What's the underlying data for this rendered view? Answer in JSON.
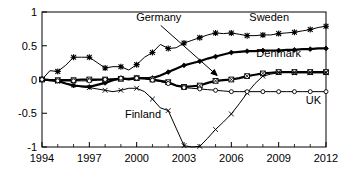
{
  "chart_data": {
    "type": "line",
    "title": "",
    "xlabel": "",
    "ylabel": "",
    "xlim": [
      1994,
      2012
    ],
    "ylim": [
      -1,
      1
    ],
    "grid": false,
    "legend_position": "inline-annotations",
    "xticks": [
      1994,
      1997,
      2000,
      2003,
      2006,
      2009,
      2012
    ],
    "xtick_labels": [
      "1994",
      "1997",
      "2000",
      "2003",
      "2006",
      "2009",
      "2012"
    ],
    "xminor_ticks": [
      1995,
      1996,
      1998,
      1999,
      2001,
      2002,
      2004,
      2005,
      2007,
      2008,
      2010,
      2011
    ],
    "yticks": [
      -1,
      -0.5,
      0,
      0.5,
      1
    ],
    "ytick_labels": [
      "-1",
      "-0.5",
      "0",
      "0.5",
      "1"
    ],
    "x": [
      1994,
      1994.5,
      1995,
      1995.5,
      1996,
      1996.5,
      1997,
      1997.5,
      1998,
      1998.5,
      1999,
      1999.5,
      2000,
      2000.5,
      2001,
      2001.5,
      2002,
      2002.5,
      2003,
      2003.5,
      2004,
      2004.5,
      2005,
      2005.5,
      2006,
      2006.5,
      2007,
      2007.5,
      2008,
      2008.5,
      2009,
      2009.5,
      2010,
      2010.5,
      2011,
      2011.5,
      2012
    ],
    "series": [
      {
        "name": "Sweden",
        "marker": "star",
        "line_width": 1,
        "color": "#000000",
        "values": [
          0.0,
          0.13,
          0.12,
          0.21,
          0.33,
          0.33,
          0.33,
          0.25,
          0.17,
          0.19,
          0.19,
          0.14,
          0.22,
          0.33,
          0.4,
          0.52,
          0.46,
          0.47,
          0.54,
          0.58,
          0.62,
          0.66,
          0.69,
          0.68,
          0.69,
          0.67,
          0.65,
          0.65,
          0.66,
          0.66,
          0.68,
          0.69,
          0.7,
          0.72,
          0.74,
          0.77,
          0.79
        ]
      },
      {
        "name": "Denmark",
        "marker": "diamond",
        "line_width": 2.2,
        "color": "#000000",
        "values": [
          0.0,
          -0.01,
          -0.02,
          -0.06,
          -0.09,
          -0.1,
          -0.11,
          -0.08,
          -0.05,
          -0.01,
          0.02,
          0.0,
          0.02,
          0.02,
          0.02,
          0.06,
          0.11,
          0.16,
          0.21,
          0.24,
          0.27,
          0.31,
          0.34,
          0.37,
          0.4,
          0.41,
          0.42,
          0.42,
          0.43,
          0.43,
          0.43,
          0.44,
          0.44,
          0.45,
          0.45,
          0.46,
          0.46
        ]
      },
      {
        "name": "Germany",
        "marker": "square-x",
        "line_width": 2.2,
        "color": "#000000",
        "values": [
          0.0,
          -0.01,
          -0.01,
          -0.01,
          -0.01,
          0.0,
          0.0,
          0.0,
          0.0,
          0.0,
          0.01,
          0.01,
          0.02,
          0.02,
          0.0,
          -0.02,
          -0.04,
          -0.09,
          -0.11,
          -0.1,
          -0.09,
          -0.05,
          -0.02,
          -0.01,
          0.0,
          0.02,
          0.05,
          0.07,
          0.09,
          0.1,
          0.11,
          0.11,
          0.11,
          0.11,
          0.11,
          0.11,
          0.11
        ]
      },
      {
        "name": "Finland",
        "marker": "x",
        "line_width": 1,
        "color": "#000000",
        "values": [
          0.0,
          -0.01,
          -0.03,
          -0.06,
          -0.08,
          -0.11,
          -0.12,
          -0.14,
          -0.16,
          -0.18,
          -0.16,
          -0.13,
          -0.13,
          -0.18,
          -0.29,
          -0.42,
          -0.46,
          -0.72,
          -0.98,
          -1.0,
          -0.99,
          -0.87,
          -0.74,
          -0.63,
          -0.51,
          -0.36,
          -0.2,
          -0.06,
          0.05,
          0.08,
          0.1,
          0.11,
          0.1,
          0.1,
          0.1,
          0.1,
          0.1
        ]
      },
      {
        "name": "UK",
        "marker": "circle",
        "line_width": 1,
        "color": "#000000",
        "values": [
          0.0,
          -0.01,
          -0.02,
          -0.02,
          -0.02,
          -0.02,
          -0.02,
          -0.01,
          0.0,
          0.01,
          0.02,
          0.01,
          0.02,
          0.01,
          -0.01,
          -0.03,
          -0.06,
          -0.09,
          -0.12,
          -0.13,
          -0.14,
          -0.15,
          -0.16,
          -0.17,
          -0.18,
          -0.18,
          -0.18,
          -0.18,
          -0.18,
          -0.18,
          -0.18,
          -0.18,
          -0.18,
          -0.18,
          -0.18,
          -0.18,
          -0.18
        ]
      }
    ],
    "annotations": [
      {
        "text": "Germany",
        "x": 2001.4,
        "y": 0.86,
        "anchor": "middle",
        "has_arrow": true,
        "arrow_to_x": 2005.1,
        "arrow_to_y": 0.06
      },
      {
        "text": "Sweden",
        "x": 2008.4,
        "y": 0.86,
        "anchor": "middle",
        "has_arrow": false
      },
      {
        "text": "Denmark",
        "x": 2009.0,
        "y": 0.34,
        "anchor": "middle",
        "has_arrow": false
      },
      {
        "text": "UK",
        "x": 2011.2,
        "y": -0.37,
        "anchor": "middle",
        "has_arrow": false
      },
      {
        "text": "Finland",
        "x": 2000.4,
        "y": -0.57,
        "anchor": "middle",
        "has_arrow": false
      }
    ]
  }
}
